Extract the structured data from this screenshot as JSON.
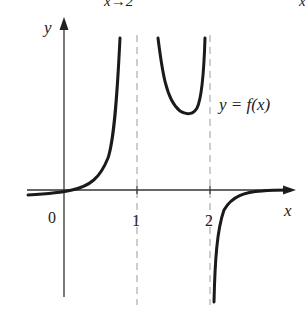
{
  "figure": {
    "top_cut_text_left": "x→2",
    "top_cut_text_right": "x",
    "y_axis_label": "y",
    "x_axis_label": "x",
    "curve_label": "y = f(x)",
    "ticks": [
      {
        "label": "0"
      },
      {
        "label": "1"
      },
      {
        "label": "2"
      }
    ],
    "asymptotes": [
      "x = 1",
      "x = 2"
    ],
    "colors": {
      "curve": "#1a1a1a",
      "axis": "#333333",
      "asymptote": "#999999"
    }
  }
}
